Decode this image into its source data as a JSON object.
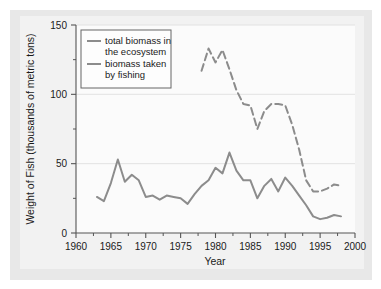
{
  "figure": {
    "background": "#ffffff",
    "panel_color": "#e8e8e8",
    "plot_color": "#f2f2f2"
  },
  "chart_data": {
    "type": "line",
    "title": "",
    "xlabel": "Year",
    "ylabel": "Weight of Fish (thousands of metric tons)",
    "xlim": [
      1960,
      2000
    ],
    "ylim": [
      0,
      150
    ],
    "xticks": [
      1960,
      1965,
      1970,
      1975,
      1980,
      1985,
      1990,
      1995,
      2000
    ],
    "yticks": [
      0,
      50,
      100,
      150
    ],
    "yminorticks": [
      25,
      75,
      125
    ],
    "grid": true,
    "grid_axis": "y",
    "legend_position": "upper left",
    "series": [
      {
        "name": "total biomass in the ecosystem",
        "style": "dashed",
        "color": "#8c8c8c",
        "x": [
          1978,
          1979,
          1980,
          1981,
          1982,
          1983,
          1984,
          1985,
          1986,
          1987,
          1988,
          1989,
          1990,
          1991,
          1992,
          1993,
          1994,
          1995,
          1996,
          1997,
          1998
        ],
        "values": [
          117,
          133,
          123,
          132,
          118,
          103,
          93,
          92,
          75,
          88,
          93,
          93,
          92,
          78,
          60,
          38,
          30,
          30,
          32,
          35,
          34
        ]
      },
      {
        "name": "biomass taken by fishing",
        "style": "solid",
        "color": "#8c8c8c",
        "x": [
          1963,
          1964,
          1965,
          1966,
          1967,
          1968,
          1969,
          1970,
          1971,
          1972,
          1973,
          1974,
          1975,
          1976,
          1977,
          1978,
          1979,
          1980,
          1981,
          1982,
          1983,
          1984,
          1985,
          1986,
          1987,
          1988,
          1989,
          1990,
          1991,
          1992,
          1993,
          1994,
          1995,
          1996,
          1997,
          1998
        ],
        "values": [
          26,
          23,
          36,
          53,
          37,
          42,
          38,
          26,
          27,
          24,
          27,
          26,
          25,
          21,
          28,
          34,
          38,
          47,
          43,
          58,
          45,
          38,
          38,
          25,
          34,
          39,
          30,
          40,
          34,
          27,
          20,
          12,
          10,
          11,
          13,
          12
        ]
      }
    ]
  },
  "legend": {
    "entries": [
      {
        "label_line1": "total biomass in",
        "label_line2": "the ecosystem"
      },
      {
        "label_line1": "biomass taken",
        "label_line2": "by fishing"
      }
    ]
  },
  "axes": {
    "x_title": "Year",
    "y_title": "Weight of Fish (thousands of metric tons)",
    "x_tick_labels": [
      "1960",
      "1965",
      "1970",
      "1975",
      "1980",
      "1985",
      "1990",
      "1995",
      "2000"
    ],
    "y_tick_labels": [
      "0",
      "50",
      "100",
      "150"
    ]
  }
}
